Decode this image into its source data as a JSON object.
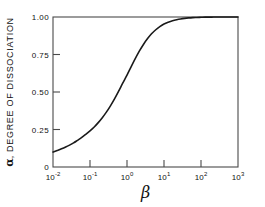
{
  "chart_data": {
    "type": "line",
    "title": "",
    "subtitle": "",
    "xlabel": "β",
    "ylabel": "α, DEGREE OF DISSOCIATION",
    "ylabel_symbol": "α",
    "ylabel_text": ", DEGREE OF DISSOCIATION",
    "xscale": "log",
    "yscale": "linear",
    "xlim": [
      0.01,
      1000
    ],
    "ylim": [
      0,
      1.0
    ],
    "grid": false,
    "legend": null,
    "xticks": [
      0.01,
      0.1,
      1,
      10,
      100,
      1000
    ],
    "xtick_labels": [
      {
        "mantissa": "10",
        "exponent": "-2"
      },
      {
        "mantissa": "10",
        "exponent": "-1"
      },
      {
        "mantissa": "10",
        "exponent": "0"
      },
      {
        "mantissa": "10",
        "exponent": "1"
      },
      {
        "mantissa": "10",
        "exponent": "2"
      },
      {
        "mantissa": "10",
        "exponent": "3"
      }
    ],
    "yticks": [
      0,
      0.25,
      0.5,
      0.75,
      1.0
    ],
    "ytick_labels": [
      "0",
      "0.25",
      "0.50",
      "0.75",
      "1.00"
    ],
    "series": [
      {
        "name": "degree of dissociation",
        "color": "#1a1a1a",
        "linewidth": 1.6,
        "x": [
          0.01,
          0.013,
          0.017,
          0.022,
          0.028,
          0.036,
          0.046,
          0.06,
          0.077,
          0.1,
          0.13,
          0.167,
          0.215,
          0.277,
          0.357,
          0.46,
          0.59,
          0.76,
          1.0,
          1.29,
          1.67,
          2.15,
          2.78,
          3.6,
          4.6,
          6.0,
          7.7,
          10.0,
          13.0,
          17.0,
          22.0,
          28.0,
          36.0,
          46.0,
          60.0,
          77.0,
          100.0,
          130.0,
          170.0,
          220.0,
          300.0,
          460.0,
          700.0,
          1000.0
        ],
        "y": [
          0.1,
          0.11,
          0.121,
          0.133,
          0.146,
          0.161,
          0.178,
          0.197,
          0.218,
          0.241,
          0.267,
          0.296,
          0.329,
          0.366,
          0.408,
          0.454,
          0.504,
          0.557,
          0.613,
          0.668,
          0.722,
          0.772,
          0.817,
          0.856,
          0.888,
          0.915,
          0.936,
          0.953,
          0.965,
          0.975,
          0.982,
          0.987,
          0.991,
          0.994,
          0.996,
          0.997,
          0.998,
          0.999,
          0.999,
          1.0,
          1.0,
          1.0,
          1.0,
          1.0
        ]
      }
    ],
    "annotations": []
  },
  "axes": {
    "frame_color": "#4a4a4a",
    "text_color": "#111111",
    "background": "#ffffff"
  }
}
